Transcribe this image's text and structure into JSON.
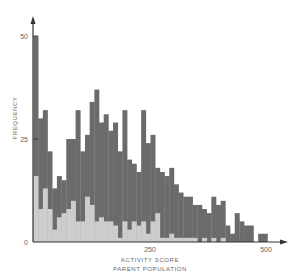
{
  "chart_data": {
    "type": "bar",
    "subtype": "overlaid-histogram",
    "title": "",
    "xlabel": "ACTIVITY SCORE",
    "xlabel_sub": "PARENT POPULATION",
    "ylabel": "FREQUENCY",
    "xlim": [
      0,
      520
    ],
    "ylim": [
      0,
      52
    ],
    "x_ticks": [
      0,
      250,
      500
    ],
    "x_tick_labels": [
      "",
      "250",
      "500"
    ],
    "y_ticks": [
      0,
      25,
      50
    ],
    "y_tick_labels": [
      "0",
      "25",
      "50"
    ],
    "bin_width": 10,
    "grid": false,
    "legend": null,
    "colors": {
      "total": "#6b6b6b",
      "subset": "#cdcdcd",
      "axis": "#333333"
    },
    "bins_start": [
      0,
      10,
      20,
      30,
      40,
      50,
      60,
      70,
      80,
      90,
      100,
      110,
      120,
      130,
      140,
      150,
      160,
      170,
      180,
      190,
      200,
      210,
      220,
      230,
      240,
      250,
      260,
      270,
      280,
      290,
      300,
      310,
      320,
      330,
      340,
      350,
      360,
      370,
      380,
      390,
      400,
      410,
      420,
      430,
      440,
      450,
      460,
      470,
      480,
      490,
      500
    ],
    "series": [
      {
        "name": "total",
        "values": [
          50,
          30,
          32,
          22,
          13,
          16,
          15,
          25,
          25,
          32,
          22,
          26,
          34,
          37,
          29,
          31,
          27,
          29,
          22,
          32,
          20,
          19,
          17,
          32,
          24,
          26,
          18,
          17,
          16,
          18,
          14,
          12,
          11,
          11,
          9,
          9,
          8,
          7,
          11,
          9,
          10,
          4,
          2,
          7,
          5,
          4,
          4,
          0,
          2,
          2,
          0
        ]
      },
      {
        "name": "subset",
        "values": [
          16,
          8,
          13,
          8,
          3,
          6,
          7,
          8,
          10,
          5,
          5,
          11,
          9,
          5,
          6,
          5,
          5,
          4,
          1,
          5,
          3,
          5,
          4,
          5,
          2,
          5,
          7,
          1,
          1,
          2,
          1,
          1,
          1,
          1,
          1,
          0,
          1,
          0,
          1,
          0,
          1,
          0,
          0,
          0,
          0,
          0,
          0,
          0,
          0,
          0,
          0
        ]
      }
    ]
  }
}
